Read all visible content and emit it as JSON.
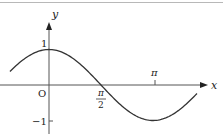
{
  "figure": {
    "function": "y = cos x",
    "axes": {
      "x_label": "x",
      "y_label": "y",
      "origin_label": "O"
    },
    "ticks": {
      "y_pos_one": "1",
      "y_neg_one": "−1",
      "x_half_pi_num": "π",
      "x_half_pi_den": "2",
      "x_pi": "π"
    },
    "colors": {
      "curve": "#333333",
      "axes": "#555555",
      "background": "#ffffff"
    }
  },
  "chart_data": {
    "type": "line",
    "title": "",
    "xlabel": "x",
    "ylabel": "y",
    "function": "cos(x)",
    "x_ticks": [
      "π/2",
      "π"
    ],
    "y_ticks": [
      "1",
      "-1"
    ],
    "xlim": [
      -1.18,
      4.47
    ],
    "ylim": [
      -1,
      1
    ],
    "key_points": [
      {
        "x": 0,
        "y": 1
      },
      {
        "x": 1.5708,
        "y": 0
      },
      {
        "x": 3.1416,
        "y": -1
      }
    ],
    "grid": false,
    "legend": null
  }
}
